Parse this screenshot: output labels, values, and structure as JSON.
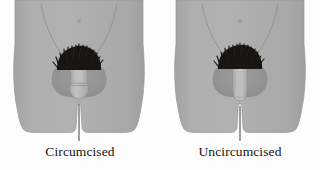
{
  "illustration": {
    "title": "Circumcised versus uncircumcised comparison",
    "subject": "male-lower-torso-anatomy",
    "background_color": "#fdfdfd",
    "figure_count": 2
  },
  "colors": {
    "background": "#fdfdfd",
    "skin_body": "#a9a9a9",
    "skin_body_light": "#b3b3b3",
    "skin_shadow": "#9a9a9a",
    "scrotum_shadow": "#8f8f8f",
    "shaft_light": "#b8b8b8",
    "shaft_highlight": "#c2c2c2",
    "outline": "#8d8d8d",
    "hair": "#191511",
    "leader_line": "#2b2b2b",
    "label_text": "#141414",
    "navel": "#9b9b9b"
  },
  "figures": [
    {
      "id": "figure-circumcised",
      "label": "Circumcised",
      "position": "left",
      "center_x": 79,
      "glans_style": "exposed-rounded-glans",
      "shaft_length": "short",
      "shaft_width": "wide",
      "has_pubic_hair": true,
      "has_navel": true,
      "has_inguinal_creases": true,
      "leader_line": {
        "x": 79,
        "y_top": 104,
        "y_bottom": 141
      }
    },
    {
      "id": "figure-uncircumcised",
      "label": "Uncircumcised",
      "position": "right",
      "center_x": 240,
      "glans_style": "covered-tapered-foreskin",
      "shaft_length": "long",
      "shaft_width": "narrow",
      "has_pubic_hair": true,
      "has_navel": true,
      "has_inguinal_creases": true,
      "leader_line": {
        "x": 240,
        "y_top": 106,
        "y_bottom": 141
      }
    }
  ],
  "labels": {
    "left": "Circumcised",
    "right": "Uncircumcised"
  }
}
